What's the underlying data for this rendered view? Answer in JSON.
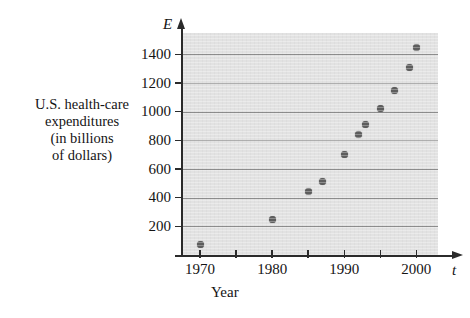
{
  "figure": {
    "y_axis_symbol": "E",
    "x_axis_symbol": "t",
    "x_axis_caption": "Year",
    "y_axis_caption_lines": [
      "U.S. health-care",
      "expenditures",
      "(in billions",
      "of dollars)"
    ]
  },
  "colors": {
    "plot_background": "#e2e2e2",
    "gridline": "#8d8d8d",
    "axis": "#2b2b2b",
    "datapoint": "#5d5d5d",
    "text": "#141414",
    "page_background": "#ffffff"
  },
  "chart_data": {
    "type": "scatter",
    "title": "",
    "xlabel": "Year",
    "ylabel": "U.S. health-care expenditures (in billions of dollars)",
    "x_symbol": "t",
    "y_symbol": "E",
    "xlim": [
      1967.5,
      2003
    ],
    "ylim": [
      0,
      1550
    ],
    "grid": true,
    "legend": false,
    "x_ticks_major": [
      1970,
      1980,
      1990,
      2000
    ],
    "x_ticks_all": [
      1970,
      1975,
      1980,
      1985,
      1990,
      1995,
      2000
    ],
    "x_tick_labels": [
      "1970",
      "1980",
      "1990",
      "2000"
    ],
    "y_ticks": [
      200,
      400,
      600,
      800,
      1000,
      1200,
      1400
    ],
    "y_tick_labels": [
      "200",
      "400",
      "600",
      "800",
      "1000",
      "1200",
      "1400"
    ],
    "points": [
      {
        "x": 1970,
        "y": 75
      },
      {
        "x": 1980,
        "y": 250
      },
      {
        "x": 1985,
        "y": 440
      },
      {
        "x": 1987,
        "y": 510
      },
      {
        "x": 1990,
        "y": 700
      },
      {
        "x": 1992,
        "y": 840
      },
      {
        "x": 1993,
        "y": 910
      },
      {
        "x": 1995,
        "y": 1020
      },
      {
        "x": 1997,
        "y": 1150
      },
      {
        "x": 1999,
        "y": 1310
      },
      {
        "x": 2000,
        "y": 1450
      }
    ]
  }
}
